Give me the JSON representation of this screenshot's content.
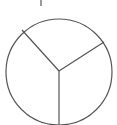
{
  "diagram": {
    "type": "circle-divided-into-three-sectors",
    "sectors": 3,
    "stroke_color": "#555555",
    "background": "#ffffff"
  }
}
